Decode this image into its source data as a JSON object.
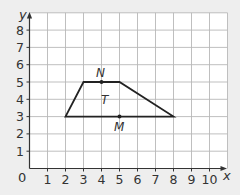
{
  "diagram": {
    "type": "coordinate-grid",
    "axes": {
      "x_label": "x",
      "y_label": "y",
      "origin_label": "0",
      "x_ticks": [
        "1",
        "2",
        "3",
        "4",
        "5",
        "6",
        "7",
        "8",
        "9",
        "10"
      ],
      "y_ticks": [
        "1",
        "2",
        "3",
        "4",
        "5",
        "6",
        "7",
        "8"
      ]
    },
    "grid": {
      "x_min": 0,
      "x_max": 11,
      "y_min": 0,
      "y_max": 9
    },
    "shape": {
      "name": "T",
      "kind": "trapezium",
      "vertices": [
        [
          2,
          3
        ],
        [
          3,
          5
        ],
        [
          5,
          5
        ],
        [
          8,
          3
        ]
      ]
    },
    "points": [
      {
        "label": "N",
        "x": 4,
        "y": 5
      },
      {
        "label": "M",
        "x": 5,
        "y": 3
      }
    ],
    "colors": {
      "background": "#eeeeee",
      "grid_fill": "#ffffff",
      "grid_line": "#b8b8b8",
      "axis": "#333333",
      "shape": "#222222",
      "text": "#333333"
    }
  }
}
